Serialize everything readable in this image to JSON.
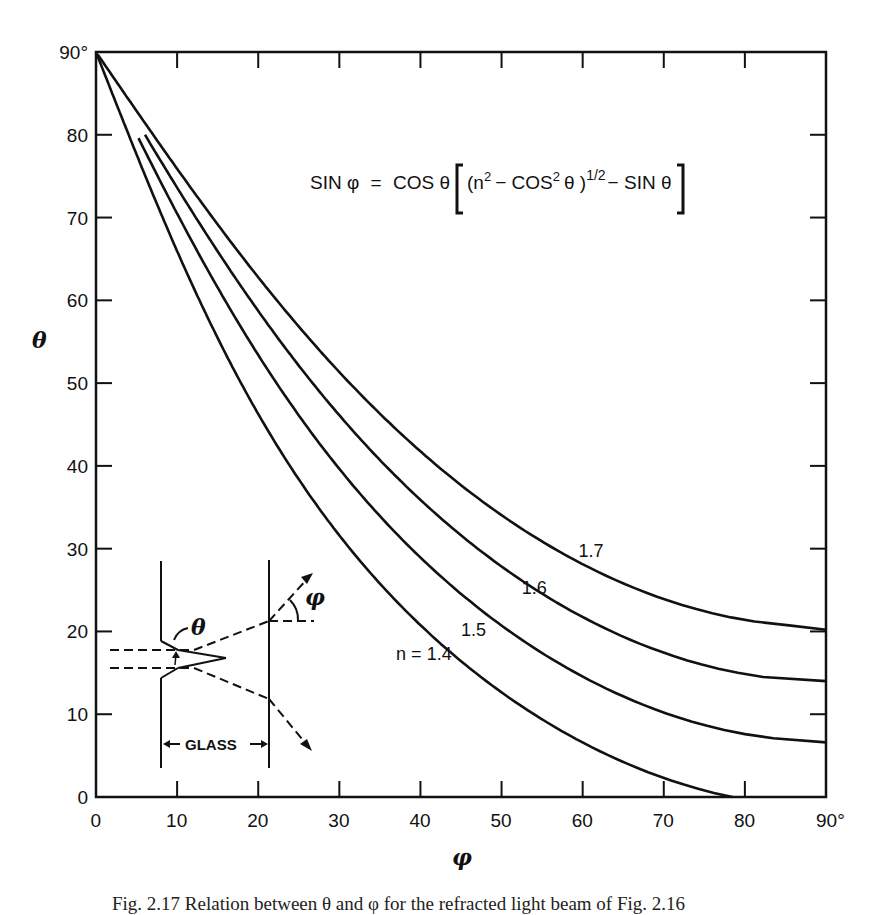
{
  "chart_data": {
    "type": "line",
    "title": "",
    "equation": "SIN φ = COS θ [(n² − COS² θ)^1/2 − SIN θ]",
    "xlabel": "φ",
    "ylabel": "θ",
    "xlim": [
      0,
      90
    ],
    "ylim": [
      0,
      90
    ],
    "x_ticks": [
      "0",
      "10",
      "20",
      "30",
      "40",
      "50",
      "60",
      "70",
      "80",
      "90°"
    ],
    "y_ticks": [
      "0",
      "10",
      "20",
      "30",
      "40",
      "50",
      "60",
      "70",
      "80",
      "90°"
    ],
    "grid": false,
    "legend": "inline curve labels",
    "series": [
      {
        "name": "n = 1.4",
        "label": "n = 1.4",
        "n": 1.4,
        "points": [
          [
            0,
            90
          ],
          [
            4.0,
            80
          ],
          [
            8.2,
            70
          ],
          [
            12.8,
            60
          ],
          [
            17.9,
            50
          ],
          [
            23.9,
            40
          ],
          [
            31.3,
            30
          ],
          [
            40.8,
            20
          ],
          [
            54.0,
            10
          ],
          [
            78.5,
            0
          ]
        ]
      },
      {
        "name": "n = 1.5",
        "label": "1.5",
        "n": 1.5,
        "points": [
          [
            5.0,
            80
          ],
          [
            10.3,
            70
          ],
          [
            15.9,
            60
          ],
          [
            22.3,
            50
          ],
          [
            29.7,
            40
          ],
          [
            38.9,
            30
          ],
          [
            51.0,
            20
          ],
          [
            70.6,
            10
          ],
          [
            90,
            6.6
          ]
        ]
      },
      {
        "name": "n = 1.6",
        "label": "1.6",
        "n": 1.6,
        "points": [
          [
            6.0,
            80
          ],
          [
            12.3,
            70
          ],
          [
            19.1,
            60
          ],
          [
            26.7,
            50
          ],
          [
            35.7,
            40
          ],
          [
            47.1,
            30
          ],
          [
            63.6,
            20
          ],
          [
            90,
            14.0
          ]
        ]
      },
      {
        "name": "n = 1.7",
        "label": "1.7",
        "n": 1.7,
        "points": [
          [
            0,
            90
          ],
          [
            7.0,
            80
          ],
          [
            14.4,
            70
          ],
          [
            22.3,
            60
          ],
          [
            31.3,
            50
          ],
          [
            42.1,
            40
          ],
          [
            56.5,
            30
          ],
          [
            90,
            20.2
          ]
        ]
      }
    ],
    "annotations": {
      "curve_labels": [
        {
          "text": "n = 1.4",
          "phi": 37,
          "theta": 16.5
        },
        {
          "text": "1.5",
          "phi": 45,
          "theta": 19.5
        },
        {
          "text": "1.6",
          "phi": 52.5,
          "theta": 24.5
        },
        {
          "text": "1.7",
          "phi": 59.5,
          "theta": 29
        }
      ],
      "inset": {
        "description": "Light ray diagram through glass with triangular groove",
        "labels": [
          "θ",
          "φ",
          "GLASS"
        ]
      }
    }
  },
  "equation": {
    "sin_phi": "SIN φ",
    "equals": "=",
    "cos_theta": "COS θ",
    "n2": "(n",
    "sup2": "2",
    "minus_cos2": "− COS",
    "sup2b": "2",
    "theta_close": "θ )",
    "sup_half": "1/2",
    "minus_sin": "− SIN θ"
  },
  "axes": {
    "x_title": "φ",
    "y_title": "θ"
  },
  "inset": {
    "theta_label": "θ",
    "phi_label": "φ",
    "glass_label": "GLASS"
  },
  "caption": "Fig. 2.17  Relation between θ and φ for the refracted light beam of Fig. 2.16"
}
